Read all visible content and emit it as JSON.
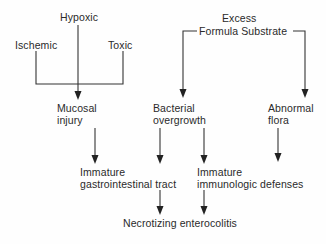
{
  "diagram": {
    "nodes": {
      "hypoxic": {
        "lines": [
          "Hypoxic"
        ]
      },
      "ischemic": {
        "lines": [
          "Ischemic"
        ]
      },
      "toxic": {
        "lines": [
          "Toxic"
        ]
      },
      "excess_formula": {
        "lines": [
          "Excess",
          "Formula Substrate"
        ]
      },
      "mucosal_injury": {
        "lines": [
          "Mucosal",
          "injury"
        ]
      },
      "bacterial_overgrowth": {
        "lines": [
          "Bacterial",
          "overgrowth"
        ]
      },
      "abnormal_flora": {
        "lines": [
          "Abnormal",
          "flora"
        ]
      },
      "immature_gi": {
        "lines": [
          "Immature",
          "gastrointestinal tract"
        ]
      },
      "immature_immuno": {
        "lines": [
          "Immature",
          "immunologic defenses"
        ]
      },
      "nec": {
        "lines": [
          "Necrotizing enterocolitis"
        ]
      }
    },
    "edges": [
      {
        "from": "ischemic",
        "to": "mucosal_injury"
      },
      {
        "from": "hypoxic",
        "to": "mucosal_injury"
      },
      {
        "from": "toxic",
        "to": "mucosal_injury"
      },
      {
        "from": "excess_formula",
        "to": "bacterial_overgrowth"
      },
      {
        "from": "excess_formula",
        "to": "abnormal_flora"
      },
      {
        "from": "mucosal_injury",
        "to": "immature_gi"
      },
      {
        "from": "bacterial_overgrowth",
        "to": "immature_gi"
      },
      {
        "from": "bacterial_overgrowth",
        "to": "immature_immuno"
      },
      {
        "from": "abnormal_flora",
        "to": null
      },
      {
        "from": "immature_gi",
        "to": "nec"
      },
      {
        "from": "immature_immuno",
        "to": "nec"
      }
    ],
    "colors": {
      "line": "#333333",
      "text": "#2a2a2a",
      "background": "#fefefe"
    }
  }
}
